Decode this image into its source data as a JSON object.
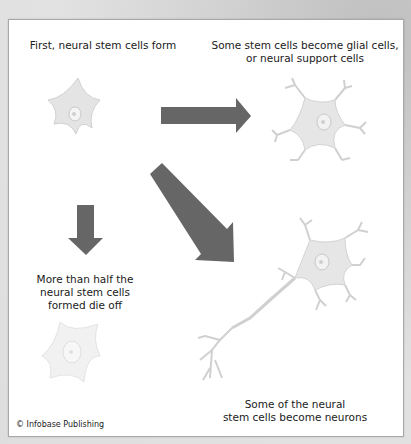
{
  "labels": {
    "step1": "First, neural stem cells form",
    "glial_line1": "Some stem cells become glial cells,",
    "glial_line2": "or neural support cells",
    "die_line1": "More than half the",
    "die_line2": "neural stem cells",
    "die_line3": "formed die off",
    "neuron_line1": "Some of the neural",
    "neuron_line2": "stem cells become neurons"
  },
  "credit": "© Infobase Publishing",
  "colors": {
    "arrow": "#666666",
    "cell_fill": "#e6e6e6",
    "cell_stroke": "#cfcfcf",
    "panel": "#ffffff"
  }
}
